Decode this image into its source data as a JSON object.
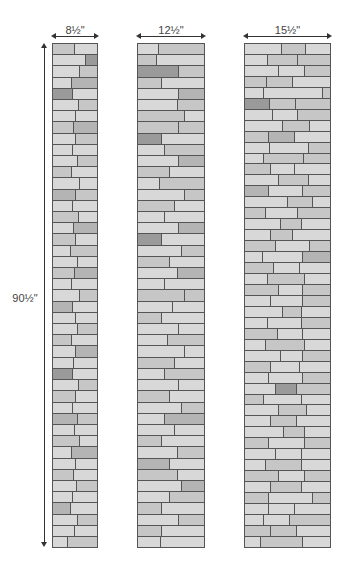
{
  "labels": {
    "strip1_width": "8½\"",
    "strip2_width": "12½\"",
    "strip3_width": "15½\"",
    "height": "90½\""
  },
  "shades": {
    "a": "#d8d8d8",
    "b": "#c6c6c6",
    "c": "#b4b4b4",
    "d": "#9a9a9a"
  },
  "strips": [
    {
      "x": 52,
      "w": 46,
      "rows": [
        "48b52a",
        "75a25d",
        "60a40b",
        "43a57c",
        "44d56a",
        "57a43b",
        "52a48a",
        "47b53c",
        "50a50b",
        "45a55a",
        "55a45b",
        "42b58a",
        "60a40a",
        "50c50b",
        "44a56a",
        "58b42a",
        "46a54c",
        "52b48a",
        "40a60b",
        "55a45a",
        "48b52c",
        "42a58a",
        "60a40b",
        "45c55a",
        "50a50a",
        "56a44b",
        "42b58a",
        "52a48c",
        "47a53a",
        "45d55a",
        "58a42b",
        "50b50a",
        "44a56a",
        "55c45b",
        "48a52a",
        "60b40a",
        "42a58c",
        "50a50a",
        "46b54a",
        "54a46b",
        "45a55a",
        "40c60a",
        "55a45b",
        "48a52a",
        "32a68b"
      ]
    },
    {
      "x": 137,
      "w": 68,
      "rows": [
        "30a70b",
        "28b72a",
        "62d38b",
        "36b64a",
        "62a38c",
        "60a40b",
        "70b30a",
        "62b38b",
        "36d64a",
        "40a60b",
        "62a38c",
        "48b52a",
        "32a68b",
        "70a30b",
        "55b45a",
        "40a60a",
        "62a38c",
        "36d64a",
        "66a34b",
        "48b52a",
        "60a40c",
        "40a60a",
        "70b30b",
        "52a48a",
        "36b64a",
        "62a38a",
        "44a56b",
        "70a30a",
        "55b45a",
        "40a60b",
        "62a38a",
        "48b52a",
        "66a34b",
        "40a60c",
        "55a45a",
        "36b64a",
        "60a40b",
        "48c52a",
        "60b40a",
        "66a34c",
        "48a52b",
        "36b64a",
        "62a38b",
        "36b64a",
        "34a66a"
      ]
    },
    {
      "x": 244,
      "w": 87,
      "rows": [
        "43a28b29a",
        "27a35b38b",
        "40a30a30b",
        "25b31b44a",
        "22a70a8b",
        "29d30b41b",
        "32a29a39b",
        "44a32b24a",
        "28b30c42a",
        "29a46a25b",
        "22a47b31b",
        "30b28a42a",
        "40a35b25a",
        "28c40a32b",
        "50a30b20a",
        "24b38a38b",
        "42a24b34a",
        "30a26b44a",
        "36b40a24b",
        "20a48a32c",
        "34b30a36a",
        "26a44b30a",
        "40b28a32b",
        "30a38a32b",
        "44a22b34a",
        "26a40a34b",
        "38b30a32a",
        "24a46b30a",
        "42a26a32b",
        "30b34a36a",
        "28a40a32b",
        "36a24d40b",
        "22b44a34a",
        "40a32b28a",
        "30a30b40a",
        "46a24b30a",
        "28b42a30b",
        "36a30a34a",
        "24a42b34a",
        "40b30a30b",
        "30a36b34a",
        "28b52a20b",
        "28a30a42a",
        "22a30a48b",
        "30b30b40a",
        "18a50b32a"
      ]
    }
  ]
}
